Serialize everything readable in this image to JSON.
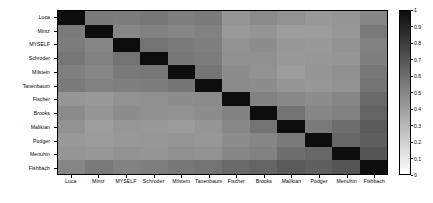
{
  "chart_data": {
    "type": "heatmap",
    "title": "",
    "xlabel": "",
    "ylabel": "",
    "grid": false,
    "colorbar": {
      "min": 0,
      "max": 1,
      "orientation": "vertical",
      "position": "right",
      "ticks": [
        "1",
        "0.9",
        "0.8",
        "0.7",
        "0.6",
        "0.5",
        "0.4",
        "0.3",
        "0.2",
        "0.1",
        "0"
      ],
      "tick_values": [
        1,
        0.9,
        0.8,
        0.7,
        0.6,
        0.5,
        0.4,
        0.3,
        0.2,
        0.1,
        0
      ],
      "colormap": "gray_reversed",
      "low_color": "#ffffff",
      "high_color": "#0d0d0d"
    },
    "x_categories": [
      "Luca",
      "Mintz",
      "MYSELF",
      "Schroder",
      "Milstein",
      "Tanenbaum",
      "Fischer",
      "Brooks",
      "Malikian",
      "Podger",
      "Menuhin",
      "Fishbach"
    ],
    "y_categories": [
      "Luca",
      "Mintz",
      "MYSELF",
      "Schroder",
      "Milstein",
      "Tanenbaum",
      "Fischer",
      "Brooks",
      "Malikian",
      "Podger",
      "Menuhin",
      "Fishbach"
    ],
    "values": [
      [
        1.0,
        0.55,
        0.54,
        0.56,
        0.53,
        0.55,
        0.44,
        0.48,
        0.45,
        0.42,
        0.44,
        0.5
      ],
      [
        0.55,
        1.0,
        0.5,
        0.52,
        0.5,
        0.52,
        0.42,
        0.44,
        0.4,
        0.41,
        0.43,
        0.55
      ],
      [
        0.54,
        0.5,
        1.0,
        0.58,
        0.55,
        0.53,
        0.45,
        0.47,
        0.43,
        0.42,
        0.45,
        0.52
      ],
      [
        0.56,
        0.52,
        0.58,
        1.0,
        0.56,
        0.54,
        0.46,
        0.46,
        0.42,
        0.43,
        0.44,
        0.53
      ],
      [
        0.53,
        0.5,
        0.55,
        0.56,
        1.0,
        0.57,
        0.47,
        0.45,
        0.41,
        0.44,
        0.46,
        0.56
      ],
      [
        0.55,
        0.52,
        0.53,
        0.54,
        0.57,
        1.0,
        0.48,
        0.47,
        0.44,
        0.43,
        0.45,
        0.58
      ],
      [
        0.44,
        0.42,
        0.45,
        0.46,
        0.47,
        0.48,
        1.0,
        0.52,
        0.49,
        0.47,
        0.5,
        0.62
      ],
      [
        0.48,
        0.44,
        0.47,
        0.46,
        0.45,
        0.47,
        0.52,
        1.0,
        0.58,
        0.5,
        0.52,
        0.64
      ],
      [
        0.45,
        0.4,
        0.43,
        0.42,
        0.41,
        0.44,
        0.49,
        0.58,
        1.0,
        0.55,
        0.6,
        0.68
      ],
      [
        0.42,
        0.41,
        0.42,
        0.43,
        0.44,
        0.43,
        0.47,
        0.5,
        0.55,
        1.0,
        0.63,
        0.66
      ],
      [
        0.44,
        0.43,
        0.45,
        0.44,
        0.46,
        0.45,
        0.5,
        0.52,
        0.6,
        0.63,
        1.0,
        0.7
      ],
      [
        0.5,
        0.55,
        0.52,
        0.53,
        0.56,
        0.58,
        0.62,
        0.64,
        0.68,
        0.66,
        0.7,
        1.0
      ]
    ]
  }
}
